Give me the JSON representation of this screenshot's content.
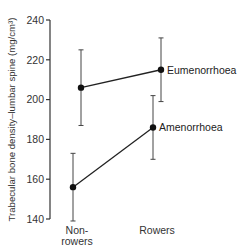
{
  "chart_data": {
    "type": "line",
    "title": "",
    "xlabel": "",
    "ylabel": "Trabecular bone density–lumbar spine (mg/cm³)",
    "ylim": [
      140,
      240
    ],
    "yticks": [
      140,
      160,
      180,
      200,
      220,
      240
    ],
    "grid": false,
    "legend": "inline labels at right end of each line",
    "categories": [
      "Non-rowers",
      "Rowers"
    ],
    "category_lines": [
      [
        "Non-",
        "rowers"
      ],
      [
        "Rowers"
      ]
    ],
    "series": [
      {
        "name": "Eumenorrhoea",
        "values": [
          206,
          215
        ],
        "error_low": [
          187,
          199
        ],
        "error_high": [
          225,
          231
        ]
      },
      {
        "name": "Amenorrhoea",
        "values": [
          156,
          186
        ],
        "error_low": [
          139,
          170
        ],
        "error_high": [
          173,
          202
        ]
      }
    ]
  }
}
